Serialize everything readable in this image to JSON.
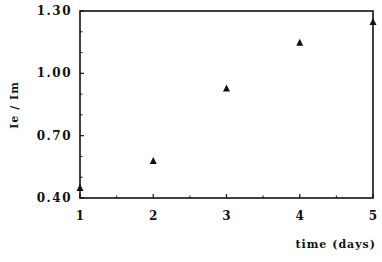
{
  "chart_data": {
    "type": "scatter",
    "title": "",
    "xlabel": "time (days)",
    "ylabel": "Ie / Im",
    "xlim": [
      1,
      5
    ],
    "ylim": [
      0.4,
      1.3
    ],
    "x_ticks": [
      "1",
      "2",
      "3",
      "4",
      "5"
    ],
    "y_ticks": [
      "0.40",
      "0.70",
      "1.00",
      "1.30"
    ],
    "grid": false,
    "legend": null,
    "marker": "triangle",
    "series": [
      {
        "name": "Ie/Im",
        "x": [
          1,
          2,
          3,
          4,
          5
        ],
        "values": [
          0.45,
          0.58,
          0.93,
          1.15,
          1.25
        ]
      }
    ]
  },
  "colors": {
    "axis": "#111111",
    "marker": "#111111",
    "background": "#ffffff"
  }
}
